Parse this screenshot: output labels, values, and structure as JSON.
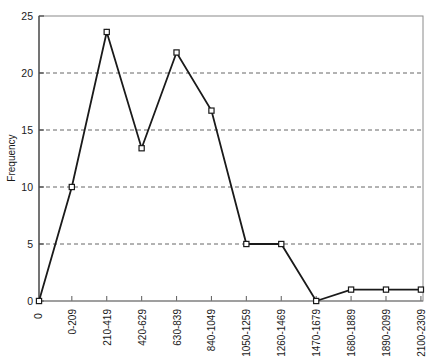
{
  "chart_data": {
    "type": "line",
    "title": "",
    "xlabel": "",
    "ylabel": "Frequency",
    "categories": [
      "0-209",
      "210-419",
      "420-629",
      "630-839",
      "840-1049",
      "1050-1259",
      "1260-1469",
      "1470-1679",
      "1680-1889",
      "1890-2099",
      "2100-2309"
    ],
    "values": [
      10,
      23.6,
      13.4,
      21.8,
      16.7,
      5,
      5,
      0,
      1,
      1,
      1
    ],
    "origin_point": {
      "label": "0",
      "value": 0
    },
    "ylim": [
      0,
      25
    ],
    "yticks": [
      0,
      5,
      10,
      15,
      20,
      25
    ],
    "ytick_labels": [
      "0",
      "5",
      "10",
      "15",
      "20",
      "25"
    ],
    "grid": true,
    "grid_style": "dashed-horizontal",
    "legend": "none",
    "marker": "open-square",
    "line_color": "#1a1a1a",
    "grid_color": "#555555",
    "axis_color": "#5a5a5a"
  }
}
